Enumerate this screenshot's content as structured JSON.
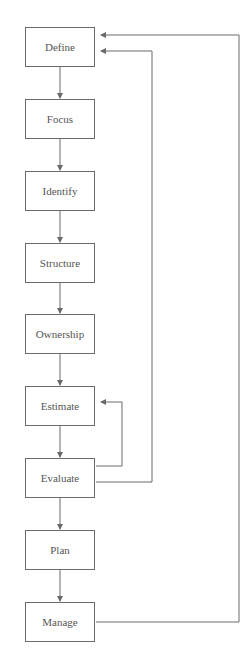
{
  "diagram": {
    "steps": [
      {
        "label": "Define"
      },
      {
        "label": "Focus"
      },
      {
        "label": "Identify"
      },
      {
        "label": "Structure"
      },
      {
        "label": "Ownership"
      },
      {
        "label": "Estimate"
      },
      {
        "label": "Evaluate"
      },
      {
        "label": "Plan"
      },
      {
        "label": "Manage"
      }
    ],
    "feedback_loops": [
      {
        "from": "Evaluate",
        "to": "Estimate"
      },
      {
        "from": "Evaluate",
        "to": "Define"
      },
      {
        "from": "Manage",
        "to": "Define"
      }
    ],
    "line_color": "#6a6a6a"
  }
}
